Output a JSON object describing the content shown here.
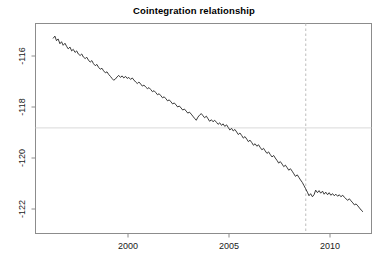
{
  "chart_data": {
    "type": "line",
    "title": "Cointegration relationship",
    "xlabel": "",
    "ylabel": "",
    "grid": false,
    "legend": null,
    "xlim": [
      1996.25,
      1996.25
    ],
    "xlim_actual": [
      1996.25,
      1996.25
    ],
    "axis": {
      "x_range": [
        1995.95,
        1611.95
      ],
      "x_ticks": [
        2000,
        2005,
        2010
      ],
      "x_tick_labels": [
        "2000",
        "2005",
        "2010"
      ],
      "y_range": [
        -122.45,
        -115.05
      ],
      "y_ticks": [
        -116,
        -118,
        -120,
        -122
      ],
      "y_tick_labels": [
        "-116",
        "-118",
        "-120",
        "-122"
      ],
      "y_label_rotation": -90
    },
    "annotations": [
      {
        "name": "mean-reference-line",
        "type": "hline",
        "y": -118.82,
        "color": "#d9d9d9",
        "style": "solid"
      },
      {
        "name": "breakpoint-line",
        "type": "vline",
        "x": 2008.8,
        "color": "#bdbdbd",
        "style": "dashed"
      }
    ],
    "series": [
      {
        "name": "cointegration residual",
        "color": "#262626",
        "x": [
          1996.3,
          1996.38,
          1996.46,
          1996.54,
          1996.63,
          1996.71,
          1996.79,
          1996.88,
          1996.96,
          1997.04,
          1997.13,
          1997.21,
          1997.29,
          1997.38,
          1997.46,
          1997.54,
          1997.63,
          1997.71,
          1997.79,
          1997.88,
          1997.96,
          1998.04,
          1998.13,
          1998.21,
          1998.29,
          1998.38,
          1998.46,
          1998.54,
          1998.63,
          1998.71,
          1998.79,
          1998.88,
          1998.96,
          1999.04,
          1999.13,
          1999.21,
          1999.29,
          1999.38,
          1999.46,
          1999.54,
          1999.63,
          1999.71,
          1999.79,
          1999.88,
          1999.96,
          2000.04,
          2000.13,
          2000.21,
          2000.29,
          2000.38,
          2000.46,
          2000.54,
          2000.63,
          2000.71,
          2000.79,
          2000.88,
          2000.96,
          2001.04,
          2001.13,
          2001.21,
          2001.29,
          2001.38,
          2001.46,
          2001.54,
          2001.63,
          2001.71,
          2001.79,
          2001.88,
          2001.96,
          2002.04,
          2002.13,
          2002.21,
          2002.29,
          2002.38,
          2002.46,
          2002.54,
          2002.63,
          2002.71,
          2002.79,
          2002.88,
          2002.96,
          2003.04,
          2003.13,
          2003.21,
          2003.29,
          2003.38,
          2003.46,
          2003.54,
          2003.63,
          2003.71,
          2003.79,
          2003.88,
          2003.96,
          2004.04,
          2004.13,
          2004.21,
          2004.29,
          2004.38,
          2004.46,
          2004.54,
          2004.63,
          2004.71,
          2004.79,
          2004.88,
          2004.96,
          2005.04,
          2005.13,
          2005.21,
          2005.29,
          2005.38,
          2005.46,
          2005.54,
          2005.63,
          2005.71,
          2005.79,
          2005.88,
          2005.96,
          2006.04,
          2006.13,
          2006.21,
          2006.29,
          2006.38,
          2006.46,
          2006.54,
          2006.63,
          2006.71,
          2006.79,
          2006.88,
          2006.96,
          2007.04,
          2007.13,
          2007.21,
          2007.29,
          2007.38,
          2007.46,
          2007.54,
          2007.63,
          2007.71,
          2007.79,
          2007.88,
          2007.96,
          2008.04,
          2008.13,
          2008.21,
          2008.29,
          2008.38,
          2008.46,
          2008.54,
          2008.63,
          2008.71,
          2008.79,
          2008.88,
          2008.96,
          2009.04,
          2009.13,
          2009.21,
          2009.29,
          2009.38,
          2009.46,
          2009.54,
          2009.63,
          2009.71,
          2009.79,
          2009.88,
          2009.96,
          2010.04,
          2010.13,
          2010.21,
          2010.29,
          2010.38,
          2010.46,
          2010.54,
          2010.63,
          2010.71,
          2010.79,
          2010.88,
          2010.96,
          2011.04,
          2011.13,
          2011.21,
          2011.29,
          2011.38,
          2011.46,
          2011.54,
          2011.62
        ],
        "y": [
          -115.3,
          -115.22,
          -115.4,
          -115.33,
          -115.52,
          -115.44,
          -115.58,
          -115.5,
          -115.62,
          -115.72,
          -115.65,
          -115.8,
          -115.74,
          -115.86,
          -115.8,
          -115.92,
          -115.98,
          -115.92,
          -116.04,
          -116.1,
          -116.05,
          -116.16,
          -116.24,
          -116.18,
          -116.3,
          -116.38,
          -116.33,
          -116.44,
          -116.52,
          -116.48,
          -116.58,
          -116.66,
          -116.62,
          -116.72,
          -116.8,
          -116.88,
          -116.95,
          -116.9,
          -116.82,
          -116.76,
          -116.84,
          -116.78,
          -116.86,
          -116.8,
          -116.88,
          -116.84,
          -116.92,
          -116.86,
          -116.94,
          -117.02,
          -117.08,
          -117.02,
          -117.1,
          -117.18,
          -117.14,
          -117.22,
          -117.28,
          -117.24,
          -117.32,
          -117.4,
          -117.36,
          -117.44,
          -117.52,
          -117.48,
          -117.56,
          -117.64,
          -117.6,
          -117.68,
          -117.76,
          -117.72,
          -117.8,
          -117.88,
          -117.84,
          -117.92,
          -118.0,
          -117.96,
          -118.04,
          -118.12,
          -118.08,
          -118.16,
          -118.24,
          -118.2,
          -118.28,
          -118.36,
          -118.44,
          -118.52,
          -118.4,
          -118.32,
          -118.26,
          -118.34,
          -118.42,
          -118.36,
          -118.46,
          -118.56,
          -118.5,
          -118.58,
          -118.52,
          -118.6,
          -118.68,
          -118.62,
          -118.72,
          -118.66,
          -118.76,
          -118.7,
          -118.8,
          -118.9,
          -118.84,
          -118.94,
          -118.88,
          -118.98,
          -119.08,
          -119.02,
          -119.12,
          -119.22,
          -119.16,
          -119.26,
          -119.36,
          -119.3,
          -119.4,
          -119.5,
          -119.44,
          -119.54,
          -119.48,
          -119.58,
          -119.68,
          -119.62,
          -119.72,
          -119.82,
          -119.76,
          -119.86,
          -119.96,
          -119.9,
          -120.0,
          -120.1,
          -120.2,
          -120.14,
          -120.24,
          -120.34,
          -120.28,
          -120.38,
          -120.48,
          -120.42,
          -120.52,
          -120.62,
          -120.72,
          -120.66,
          -120.76,
          -120.86,
          -120.96,
          -121.08,
          -121.2,
          -121.34,
          -121.48,
          -121.4,
          -121.52,
          -121.44,
          -121.26,
          -121.36,
          -121.28,
          -121.38,
          -121.3,
          -121.42,
          -121.34,
          -121.44,
          -121.36,
          -121.46,
          -121.4,
          -121.48,
          -121.42,
          -121.5,
          -121.44,
          -121.52,
          -121.46,
          -121.54,
          -121.6,
          -121.66,
          -121.6,
          -121.68,
          -121.76,
          -121.84,
          -121.8,
          -121.88,
          -121.96,
          -122.04,
          -122.1
        ]
      }
    ]
  }
}
